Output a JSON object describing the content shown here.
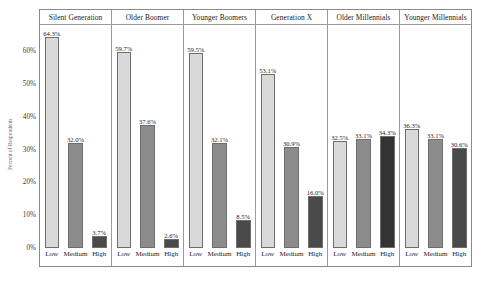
{
  "chart_data": {
    "type": "bar",
    "title": "",
    "subtitle": "",
    "xlabel": "",
    "ylabel": "Percent of Respondents",
    "ylim": [
      0,
      68
    ],
    "grid": false,
    "legend": "none",
    "layout": "faceted-small-multiples",
    "facet_variable": "Generation",
    "categories": [
      "Low",
      "Medium",
      "High"
    ],
    "y_ticks": [
      "0%",
      "10%",
      "20%",
      "30%",
      "40%",
      "50%",
      "60%"
    ],
    "y_tick_values": [
      0,
      10,
      20,
      30,
      40,
      50,
      60
    ],
    "category_colors": {
      "Low": "#d9d9d9",
      "Medium": "#8c8c8c",
      "High": "#404040"
    },
    "panels": [
      {
        "title": "Silent Generation",
        "bars": [
          {
            "category": "Low",
            "value": 64.3,
            "label": "64.3%",
            "color": "#d9d9d9"
          },
          {
            "category": "Medium",
            "value": 32.0,
            "label": "32.0%",
            "color": "#8c8c8c"
          },
          {
            "category": "High",
            "value": 3.7,
            "label": "3.7%",
            "color": "#4a4a4a"
          }
        ]
      },
      {
        "title": "Older Boomer",
        "bars": [
          {
            "category": "Low",
            "value": 59.7,
            "label": "59.7%",
            "color": "#d9d9d9"
          },
          {
            "category": "Medium",
            "value": 37.6,
            "label": "37.6%",
            "color": "#8c8c8c"
          },
          {
            "category": "High",
            "value": 2.6,
            "label": "2.6%",
            "color": "#4a4a4a"
          }
        ]
      },
      {
        "title": "Younger Boomers",
        "bars": [
          {
            "category": "Low",
            "value": 59.5,
            "label": "59.5%",
            "color": "#d9d9d9"
          },
          {
            "category": "Medium",
            "value": 32.1,
            "label": "32.1%",
            "color": "#8c8c8c"
          },
          {
            "category": "High",
            "value": 8.5,
            "label": "8.5%",
            "color": "#4a4a4a"
          }
        ]
      },
      {
        "title": "Generation X",
        "bars": [
          {
            "category": "Low",
            "value": 53.1,
            "label": "53.1%",
            "color": "#d9d9d9"
          },
          {
            "category": "Medium",
            "value": 30.9,
            "label": "30.9%",
            "color": "#8c8c8c"
          },
          {
            "category": "High",
            "value": 16.0,
            "label": "16.0%",
            "color": "#4a4a4a"
          }
        ]
      },
      {
        "title": "Older Millennials",
        "bars": [
          {
            "category": "Low",
            "value": 32.5,
            "label": "32.5%",
            "color": "#d9d9d9"
          },
          {
            "category": "Medium",
            "value": 33.1,
            "label": "33.1%",
            "color": "#8c8c8c"
          },
          {
            "category": "High",
            "value": 34.3,
            "label": "34.3%",
            "color": "#333333"
          }
        ]
      },
      {
        "title": "Younger Millennials",
        "bars": [
          {
            "category": "Low",
            "value": 36.3,
            "label": "36.3%",
            "color": "#d9d9d9"
          },
          {
            "category": "Medium",
            "value": 33.1,
            "label": "33.1%",
            "color": "#8c8c8c"
          },
          {
            "category": "High",
            "value": 30.6,
            "label": "30.6%",
            "color": "#4a4a4a"
          }
        ]
      }
    ]
  }
}
